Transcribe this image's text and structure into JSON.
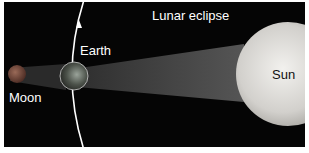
{
  "diagram": {
    "title": "Lunar eclipse",
    "labels": {
      "earth": "Earth",
      "moon": "Moon",
      "sun": "Sun"
    },
    "colors": {
      "background": "#050505",
      "shadow": "#4a4a4a",
      "orbit": "#ffffff",
      "sun": "#d8d6d2",
      "earth": "#5a5e58",
      "moon": "#7a4a3c"
    }
  }
}
